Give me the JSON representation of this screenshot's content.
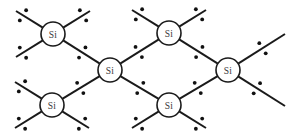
{
  "figure": {
    "width": 291,
    "height": 132,
    "background_color": "#ffffff",
    "line_color": "#1a1a1a",
    "dot_color": "#111111",
    "label_color": "#3a3a3a",
    "atom_fill_color": "#ffffff",
    "atom_radius": 12,
    "dot_radius": 1.9,
    "bond_stroke_width": 2
  },
  "atoms": [
    {
      "id": "si-top-left",
      "label": "Si",
      "cx": 53,
      "cy": 34
    },
    {
      "id": "si-top-right",
      "label": "Si",
      "cx": 169,
      "cy": 33
    },
    {
      "id": "si-center",
      "label": "Si",
      "cx": 110,
      "cy": 70
    },
    {
      "id": "si-right",
      "label": "Si",
      "cx": 228,
      "cy": 70
    },
    {
      "id": "si-bottom-left",
      "label": "Si",
      "cx": 52,
      "cy": 105
    },
    {
      "id": "si-bottom-right",
      "label": "Si",
      "cx": 169,
      "cy": 105
    }
  ],
  "bonds": [
    {
      "id": "bond-topleft-up-left",
      "x1": 53,
      "y1": 34,
      "x2": 16,
      "y2": 11,
      "shared": false
    },
    {
      "id": "bond-topleft-up-right",
      "x1": 53,
      "y1": 34,
      "x2": 90,
      "y2": 11,
      "shared": false
    },
    {
      "id": "bond-topleft-down-left",
      "x1": 53,
      "y1": 34,
      "x2": 16,
      "y2": 57,
      "shared": false
    },
    {
      "id": "bond-topleft-center",
      "x1": 53,
      "y1": 34,
      "x2": 110,
      "y2": 70,
      "shared": true
    },
    {
      "id": "bond-topright-up-left",
      "x1": 169,
      "y1": 33,
      "x2": 132,
      "y2": 10,
      "shared": false
    },
    {
      "id": "bond-topright-up-right",
      "x1": 169,
      "y1": 33,
      "x2": 206,
      "y2": 10,
      "shared": false
    },
    {
      "id": "bond-topright-center",
      "x1": 169,
      "y1": 33,
      "x2": 110,
      "y2": 70,
      "shared": true
    },
    {
      "id": "bond-topright-right",
      "x1": 169,
      "y1": 33,
      "x2": 228,
      "y2": 70,
      "shared": true
    },
    {
      "id": "bond-center-bottomleft",
      "x1": 110,
      "y1": 70,
      "x2": 52,
      "y2": 105,
      "shared": true
    },
    {
      "id": "bond-center-bottomright",
      "x1": 110,
      "y1": 70,
      "x2": 169,
      "y2": 105,
      "shared": true
    },
    {
      "id": "bond-right-up-right",
      "x1": 228,
      "y1": 70,
      "x2": 285,
      "y2": 34,
      "shared": false
    },
    {
      "id": "bond-right-down-right",
      "x1": 228,
      "y1": 70,
      "x2": 285,
      "y2": 106,
      "shared": false
    },
    {
      "id": "bond-right-bottomright",
      "x1": 228,
      "y1": 70,
      "x2": 169,
      "y2": 105,
      "shared": true
    },
    {
      "id": "bond-bottomleft-left-up",
      "x1": 52,
      "y1": 105,
      "x2": 15,
      "y2": 82,
      "shared": false
    },
    {
      "id": "bond-bottomleft-down-left",
      "x1": 52,
      "y1": 105,
      "x2": 15,
      "y2": 128,
      "shared": false
    },
    {
      "id": "bond-bottomleft-down-right",
      "x1": 52,
      "y1": 105,
      "x2": 89,
      "y2": 128,
      "shared": false
    },
    {
      "id": "bond-bottomright-down-left",
      "x1": 169,
      "y1": 105,
      "x2": 132,
      "y2": 128,
      "shared": false
    },
    {
      "id": "bond-bottomright-down-right",
      "x1": 169,
      "y1": 105,
      "x2": 206,
      "y2": 128,
      "shared": false
    }
  ],
  "electron_pairs": [
    {
      "bond": "bond-topleft-up-left",
      "t": 0.74,
      "offset": 6
    },
    {
      "bond": "bond-topleft-up-right",
      "t": 0.74,
      "offset": 6
    },
    {
      "bond": "bond-topleft-down-left",
      "t": 0.74,
      "offset": 6
    },
    {
      "bond": "bond-topleft-center",
      "t": 0.52,
      "offset": 6
    },
    {
      "bond": "bond-topright-up-left",
      "t": 0.74,
      "offset": 6
    },
    {
      "bond": "bond-topright-up-right",
      "t": 0.74,
      "offset": 6
    },
    {
      "bond": "bond-topright-center",
      "t": 0.52,
      "offset": 6
    },
    {
      "bond": "bond-topright-right",
      "t": 0.52,
      "offset": 6
    },
    {
      "bond": "bond-center-bottomleft",
      "t": 0.52,
      "offset": 6
    },
    {
      "bond": "bond-center-bottomright",
      "t": 0.52,
      "offset": 6
    },
    {
      "bond": "bond-right-up-right",
      "t": 0.52,
      "offset": 6
    },
    {
      "bond": "bond-right-down-right",
      "t": 0.4,
      "offset": 6
    },
    {
      "bond": "bond-right-bottomright",
      "t": 0.52,
      "offset": 6
    },
    {
      "bond": "bond-bottomleft-left-up",
      "t": 0.74,
      "offset": 6
    },
    {
      "bond": "bond-bottomleft-down-left",
      "t": 0.74,
      "offset": 6
    },
    {
      "bond": "bond-bottomleft-down-right",
      "t": 0.74,
      "offset": 6
    },
    {
      "bond": "bond-bottomright-down-left",
      "t": 0.74,
      "offset": 6
    },
    {
      "bond": "bond-bottomright-down-right",
      "t": 0.74,
      "offset": 6
    }
  ]
}
